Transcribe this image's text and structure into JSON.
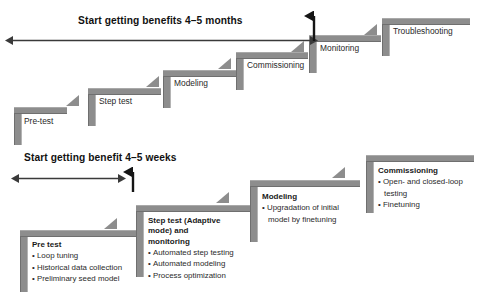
{
  "figure": {
    "title_top": "Start getting benefits 4–5 months",
    "title_bottom": "Start getting benefit 4–5 weeks",
    "colors": {
      "bar": "#8d8d8d",
      "bar_dark": "#6f6f6f",
      "text": "#2a2a2a",
      "arrow": "#3a3a3a",
      "background": "#ffffff"
    }
  },
  "top_staircase": {
    "name": "conventional-approach-staircase",
    "steps": [
      {
        "label": "Pre-test"
      },
      {
        "label": "Step test"
      },
      {
        "label": "Modeling"
      },
      {
        "label": "Commissioning"
      },
      {
        "label": "Monitoring"
      },
      {
        "label": "Troubleshooting"
      }
    ]
  },
  "bottom_staircase": {
    "name": "adaptive-approach-staircase",
    "steps": [
      {
        "title": "Pre test",
        "bullets": [
          "Loop tuning",
          "Historical data collection",
          "Preliminary seed model"
        ]
      },
      {
        "title": "Step test (Adaptive\nmode) and\nmonitoring",
        "title_lines": [
          "Step test (Adaptive",
          "mode) and",
          "monitoring"
        ],
        "bullets": [
          "Automated step testing",
          "Automated modeling",
          "Process optimization"
        ]
      },
      {
        "title": "Modeling",
        "bullets": [
          "Upgradation of initial",
          "model by finetuning"
        ],
        "bullet_flags": [
          true,
          false
        ]
      },
      {
        "title": "Commissioning",
        "bullets": [
          "Open- and closed-loop",
          "testing",
          "Finetuning"
        ],
        "bullet_flags": [
          true,
          false,
          true
        ]
      }
    ]
  },
  "annotations": {
    "bullet_glyph": "•"
  }
}
